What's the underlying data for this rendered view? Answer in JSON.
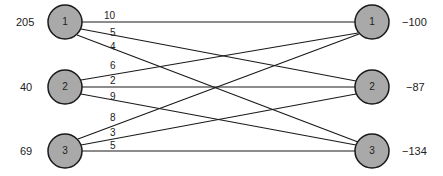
{
  "sources": [
    {
      "id": "1",
      "supply": "205",
      "cx": 65,
      "cy": 22
    },
    {
      "id": "2",
      "supply": "40",
      "cx": 65,
      "cy": 87
    },
    {
      "id": "3",
      "supply": "69",
      "cx": 65,
      "cy": 151
    }
  ],
  "destinations": [
    {
      "id": "1",
      "demand": "−100",
      "cx": 372,
      "cy": 22
    },
    {
      "id": "2",
      "demand": "−87",
      "cx": 372,
      "cy": 87
    },
    {
      "id": "3",
      "demand": "−134",
      "cx": 372,
      "cy": 151
    }
  ],
  "edges": [
    {
      "from": "1",
      "to": "1",
      "cost": "10"
    },
    {
      "from": "1",
      "to": "2",
      "cost": "5"
    },
    {
      "from": "1",
      "to": "3",
      "cost": "4"
    },
    {
      "from": "2",
      "to": "1",
      "cost": "6"
    },
    {
      "from": "2",
      "to": "2",
      "cost": "2"
    },
    {
      "from": "2",
      "to": "3",
      "cost": "9"
    },
    {
      "from": "3",
      "to": "1",
      "cost": "8"
    },
    {
      "from": "3",
      "to": "2",
      "cost": "3"
    },
    {
      "from": "3",
      "to": "3",
      "cost": "5"
    }
  ],
  "colors": {
    "node_fill": "#a9a9a9",
    "node_stroke": "#1a1a1a",
    "edge": "#1a1a1a"
  }
}
